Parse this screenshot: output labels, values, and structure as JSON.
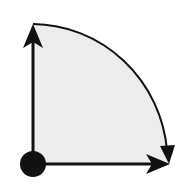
{
  "diagram": {
    "colors": {
      "background": "#ffffff",
      "fill": "#ececec",
      "stroke": "#111111",
      "origin": "#111111"
    },
    "elements": [
      {
        "name": "origin-point",
        "shape": "circle"
      },
      {
        "name": "vertical-axis-arrow",
        "direction": "up"
      },
      {
        "name": "horizontal-axis-arrow",
        "direction": "right"
      },
      {
        "name": "arc-arrow",
        "direction": "clockwise"
      },
      {
        "name": "sector-fill",
        "shape": "quarter-disc"
      }
    ]
  }
}
